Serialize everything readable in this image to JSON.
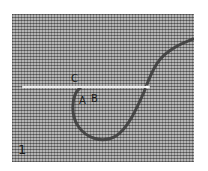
{
  "figure": {
    "number": "1",
    "labels": {
      "c": "C",
      "a": "A",
      "b": "B"
    },
    "colors": {
      "canvas": "#9a9a9a",
      "thread": "#3a3a3a",
      "needle": "#e8e8e8",
      "background": "#ffffff"
    }
  }
}
